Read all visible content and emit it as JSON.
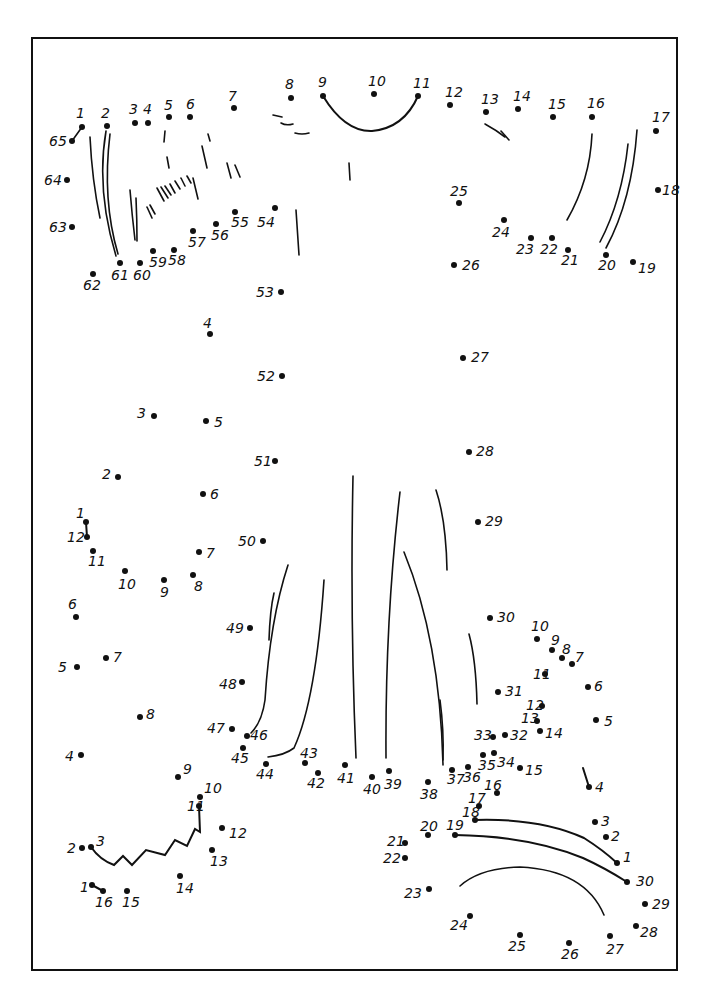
{
  "worksheet": {
    "title": "Dot-to-dot puzzle",
    "frame": {
      "x": 31,
      "y": 37,
      "width": 647,
      "height": 934
    },
    "ink_color": "#111111",
    "background": "#ffffff"
  },
  "puzzles": [
    {
      "name": "main-figure",
      "range": [
        1,
        65
      ],
      "dots": [
        {
          "n": "1",
          "x": 82,
          "y": 127,
          "lx": 76,
          "ly": 118
        },
        {
          "n": "2",
          "x": 107,
          "y": 126,
          "lx": 101,
          "ly": 118
        },
        {
          "n": "3",
          "x": 135,
          "y": 123,
          "lx": 129,
          "ly": 114
        },
        {
          "n": "4",
          "x": 148,
          "y": 123,
          "lx": 143,
          "ly": 114
        },
        {
          "n": "5",
          "x": 169,
          "y": 117,
          "lx": 164,
          "ly": 110
        },
        {
          "n": "6",
          "x": 190,
          "y": 117,
          "lx": 186,
          "ly": 109
        },
        {
          "n": "7",
          "x": 234,
          "y": 108,
          "lx": 228,
          "ly": 101
        },
        {
          "n": "8",
          "x": 291,
          "y": 98,
          "lx": 285,
          "ly": 89
        },
        {
          "n": "9",
          "x": 323,
          "y": 96,
          "lx": 318,
          "ly": 87
        },
        {
          "n": "10",
          "x": 374,
          "y": 94,
          "lx": 368,
          "ly": 86
        },
        {
          "n": "11",
          "x": 418,
          "y": 96,
          "lx": 413,
          "ly": 88
        },
        {
          "n": "12",
          "x": 450,
          "y": 105,
          "lx": 445,
          "ly": 97
        },
        {
          "n": "13",
          "x": 486,
          "y": 112,
          "lx": 481,
          "ly": 104
        },
        {
          "n": "14",
          "x": 518,
          "y": 109,
          "lx": 513,
          "ly": 101
        },
        {
          "n": "15",
          "x": 553,
          "y": 117,
          "lx": 548,
          "ly": 109
        },
        {
          "n": "16",
          "x": 592,
          "y": 117,
          "lx": 587,
          "ly": 108
        },
        {
          "n": "17",
          "x": 656,
          "y": 131,
          "lx": 652,
          "ly": 122
        },
        {
          "n": "18",
          "x": 658,
          "y": 190,
          "lx": 662,
          "ly": 195
        },
        {
          "n": "19",
          "x": 633,
          "y": 262,
          "lx": 638,
          "ly": 273
        },
        {
          "n": "20",
          "x": 606,
          "y": 255,
          "lx": 598,
          "ly": 270
        },
        {
          "n": "21",
          "x": 568,
          "y": 250,
          "lx": 561,
          "ly": 265
        },
        {
          "n": "22",
          "x": 552,
          "y": 238,
          "lx": 540,
          "ly": 254
        },
        {
          "n": "23",
          "x": 531,
          "y": 238,
          "lx": 516,
          "ly": 254
        },
        {
          "n": "24",
          "x": 504,
          "y": 220,
          "lx": 492,
          "ly": 237
        },
        {
          "n": "25",
          "x": 459,
          "y": 203,
          "lx": 450,
          "ly": 196
        },
        {
          "n": "26",
          "x": 454,
          "y": 265,
          "lx": 462,
          "ly": 270
        },
        {
          "n": "27",
          "x": 463,
          "y": 358,
          "lx": 471,
          "ly": 362
        },
        {
          "n": "28",
          "x": 469,
          "y": 452,
          "lx": 476,
          "ly": 456
        },
        {
          "n": "29",
          "x": 478,
          "y": 522,
          "lx": 485,
          "ly": 526
        },
        {
          "n": "30",
          "x": 490,
          "y": 618,
          "lx": 497,
          "ly": 622
        },
        {
          "n": "31",
          "x": 498,
          "y": 692,
          "lx": 505,
          "ly": 696
        },
        {
          "n": "32",
          "x": 505,
          "y": 735,
          "lx": 510,
          "ly": 740
        },
        {
          "n": "33",
          "x": 493,
          "y": 737,
          "lx": 474,
          "ly": 740
        },
        {
          "n": "34",
          "x": 494,
          "y": 753,
          "lx": 497,
          "ly": 767
        },
        {
          "n": "35",
          "x": 483,
          "y": 755,
          "lx": 478,
          "ly": 770
        },
        {
          "n": "36",
          "x": 468,
          "y": 767,
          "lx": 463,
          "ly": 782
        },
        {
          "n": "37",
          "x": 452,
          "y": 770,
          "lx": 447,
          "ly": 784
        },
        {
          "n": "38",
          "x": 428,
          "y": 782,
          "lx": 420,
          "ly": 799
        },
        {
          "n": "39",
          "x": 389,
          "y": 771,
          "lx": 384,
          "ly": 789
        },
        {
          "n": "40",
          "x": 372,
          "y": 777,
          "lx": 363,
          "ly": 794
        },
        {
          "n": "41",
          "x": 345,
          "y": 765,
          "lx": 337,
          "ly": 783
        },
        {
          "n": "42",
          "x": 318,
          "y": 773,
          "lx": 307,
          "ly": 788
        },
        {
          "n": "43",
          "x": 305,
          "y": 763,
          "lx": 300,
          "ly": 758
        },
        {
          "n": "44",
          "x": 266,
          "y": 764,
          "lx": 256,
          "ly": 779
        },
        {
          "n": "45",
          "x": 243,
          "y": 748,
          "lx": 231,
          "ly": 763
        },
        {
          "n": "46",
          "x": 247,
          "y": 736,
          "lx": 250,
          "ly": 740
        },
        {
          "n": "47",
          "x": 232,
          "y": 729,
          "lx": 207,
          "ly": 733
        },
        {
          "n": "48",
          "x": 242,
          "y": 682,
          "lx": 219,
          "ly": 689
        },
        {
          "n": "49",
          "x": 250,
          "y": 628,
          "lx": 226,
          "ly": 633
        },
        {
          "n": "50",
          "x": 263,
          "y": 541,
          "lx": 238,
          "ly": 546
        },
        {
          "n": "51",
          "x": 275,
          "y": 461,
          "lx": 254,
          "ly": 466
        },
        {
          "n": "52",
          "x": 282,
          "y": 376,
          "lx": 257,
          "ly": 381
        },
        {
          "n": "53",
          "x": 281,
          "y": 292,
          "lx": 256,
          "ly": 297
        },
        {
          "n": "54",
          "x": 275,
          "y": 208,
          "lx": 257,
          "ly": 227
        },
        {
          "n": "55",
          "x": 235,
          "y": 212,
          "lx": 231,
          "ly": 227
        },
        {
          "n": "56",
          "x": 216,
          "y": 224,
          "lx": 211,
          "ly": 240
        },
        {
          "n": "57",
          "x": 193,
          "y": 231,
          "lx": 188,
          "ly": 247
        },
        {
          "n": "58",
          "x": 174,
          "y": 250,
          "lx": 168,
          "ly": 265
        },
        {
          "n": "59",
          "x": 153,
          "y": 251,
          "lx": 149,
          "ly": 267
        },
        {
          "n": "60",
          "x": 140,
          "y": 263,
          "lx": 133,
          "ly": 280
        },
        {
          "n": "61",
          "x": 120,
          "y": 263,
          "lx": 111,
          "ly": 280
        },
        {
          "n": "62",
          "x": 93,
          "y": 274,
          "lx": 83,
          "ly": 290
        },
        {
          "n": "63",
          "x": 72,
          "y": 227,
          "lx": 49,
          "ly": 232
        },
        {
          "n": "64",
          "x": 67,
          "y": 180,
          "lx": 44,
          "ly": 185
        },
        {
          "n": "65",
          "x": 72,
          "y": 141,
          "lx": 49,
          "ly": 146
        }
      ]
    },
    {
      "name": "left-small-figure",
      "range": [
        1,
        12
      ],
      "dots": [
        {
          "n": "1",
          "x": 86,
          "y": 522,
          "lx": 76,
          "ly": 518
        },
        {
          "n": "2",
          "x": 118,
          "y": 477,
          "lx": 102,
          "ly": 479
        },
        {
          "n": "3",
          "x": 154,
          "y": 416,
          "lx": 137,
          "ly": 418
        },
        {
          "n": "4",
          "x": 210,
          "y": 334,
          "lx": 203,
          "ly": 328
        },
        {
          "n": "5",
          "x": 206,
          "y": 421,
          "lx": 214,
          "ly": 427
        },
        {
          "n": "6",
          "x": 203,
          "y": 494,
          "lx": 210,
          "ly": 499
        },
        {
          "n": "7",
          "x": 199,
          "y": 552,
          "lx": 206,
          "ly": 558
        },
        {
          "n": "8",
          "x": 193,
          "y": 575,
          "lx": 194,
          "ly": 591
        },
        {
          "n": "9",
          "x": 164,
          "y": 580,
          "lx": 160,
          "ly": 597
        },
        {
          "n": "10",
          "x": 125,
          "y": 571,
          "lx": 118,
          "ly": 589
        },
        {
          "n": "11",
          "x": 93,
          "y": 551,
          "lx": 88,
          "ly": 566
        },
        {
          "n": "12",
          "x": 87,
          "y": 537,
          "lx": 67,
          "ly": 542
        }
      ],
      "segments": [
        [
          1,
          12
        ]
      ]
    },
    {
      "name": "left-bottom-figure",
      "range": [
        1,
        16
      ],
      "dots": [
        {
          "n": "1",
          "x": 92,
          "y": 885,
          "lx": 80,
          "ly": 892
        },
        {
          "n": "2",
          "x": 82,
          "y": 848,
          "lx": 67,
          "ly": 853
        },
        {
          "n": "3",
          "x": 91,
          "y": 847,
          "lx": 96,
          "ly": 846
        },
        {
          "n": "4",
          "x": 81,
          "y": 755,
          "lx": 65,
          "ly": 761
        },
        {
          "n": "5",
          "x": 77,
          "y": 667,
          "lx": 58,
          "ly": 672
        },
        {
          "n": "6",
          "x": 76,
          "y": 617,
          "lx": 68,
          "ly": 609
        },
        {
          "n": "7",
          "x": 106,
          "y": 658,
          "lx": 113,
          "ly": 662
        },
        {
          "n": "8",
          "x": 140,
          "y": 717,
          "lx": 146,
          "ly": 719
        },
        {
          "n": "9",
          "x": 178,
          "y": 777,
          "lx": 183,
          "ly": 774
        },
        {
          "n": "10",
          "x": 200,
          "y": 797,
          "lx": 204,
          "ly": 793
        },
        {
          "n": "11",
          "x": 199,
          "y": 806,
          "lx": 187,
          "ly": 811
        },
        {
          "n": "12",
          "x": 222,
          "y": 828,
          "lx": 229,
          "ly": 838
        },
        {
          "n": "13",
          "x": 212,
          "y": 850,
          "lx": 210,
          "ly": 866
        },
        {
          "n": "14",
          "x": 180,
          "y": 876,
          "lx": 176,
          "ly": 893
        },
        {
          "n": "15",
          "x": 127,
          "y": 891,
          "lx": 122,
          "ly": 907
        },
        {
          "n": "16",
          "x": 103,
          "y": 891,
          "lx": 95,
          "ly": 907
        }
      ],
      "segments": [
        [
          1,
          16
        ]
      ]
    },
    {
      "name": "right-mid-figure",
      "range": [
        4,
        16
      ],
      "dots": [
        {
          "n": "4",
          "x": 589,
          "y": 787,
          "lx": 595,
          "ly": 792
        },
        {
          "n": "5",
          "x": 596,
          "y": 720,
          "lx": 604,
          "ly": 726
        },
        {
          "n": "6",
          "x": 588,
          "y": 687,
          "lx": 594,
          "ly": 691
        },
        {
          "n": "7",
          "x": 572,
          "y": 664,
          "lx": 575,
          "ly": 662
        },
        {
          "n": "8",
          "x": 562,
          "y": 658,
          "lx": 562,
          "ly": 654
        },
        {
          "n": "9",
          "x": 552,
          "y": 650,
          "lx": 551,
          "ly": 645
        },
        {
          "n": "10",
          "x": 537,
          "y": 639,
          "lx": 531,
          "ly": 631
        },
        {
          "n": "11",
          "x": 545,
          "y": 674,
          "lx": 533,
          "ly": 679
        },
        {
          "n": "12",
          "x": 542,
          "y": 706,
          "lx": 526,
          "ly": 710
        },
        {
          "n": "13",
          "x": 537,
          "y": 721,
          "lx": 521,
          "ly": 723
        },
        {
          "n": "14",
          "x": 540,
          "y": 731,
          "lx": 545,
          "ly": 738
        },
        {
          "n": "15",
          "x": 520,
          "y": 768,
          "lx": 525,
          "ly": 775
        },
        {
          "n": "16",
          "x": 497,
          "y": 793,
          "lx": 484,
          "ly": 790
        }
      ]
    },
    {
      "name": "right-bottom-figure",
      "range": [
        1,
        30
      ],
      "dots": [
        {
          "n": "1",
          "x": 617,
          "y": 863,
          "lx": 623,
          "ly": 862
        },
        {
          "n": "2",
          "x": 606,
          "y": 837,
          "lx": 611,
          "ly": 841
        },
        {
          "n": "3",
          "x": 595,
          "y": 822,
          "lx": 601,
          "ly": 826
        },
        {
          "n": "17",
          "x": 479,
          "y": 806,
          "lx": 468,
          "ly": 803
        },
        {
          "n": "18",
          "x": 475,
          "y": 820,
          "lx": 462,
          "ly": 817
        },
        {
          "n": "19",
          "x": 455,
          "y": 835,
          "lx": 446,
          "ly": 830
        },
        {
          "n": "20",
          "x": 428,
          "y": 835,
          "lx": 420,
          "ly": 831
        },
        {
          "n": "21",
          "x": 405,
          "y": 843,
          "lx": 387,
          "ly": 846
        },
        {
          "n": "22",
          "x": 405,
          "y": 858,
          "lx": 383,
          "ly": 863
        },
        {
          "n": "23",
          "x": 429,
          "y": 889,
          "lx": 404,
          "ly": 898
        },
        {
          "n": "24",
          "x": 470,
          "y": 916,
          "lx": 450,
          "ly": 930
        },
        {
          "n": "25",
          "x": 520,
          "y": 935,
          "lx": 508,
          "ly": 951
        },
        {
          "n": "26",
          "x": 569,
          "y": 943,
          "lx": 561,
          "ly": 959
        },
        {
          "n": "27",
          "x": 610,
          "y": 936,
          "lx": 606,
          "ly": 954
        },
        {
          "n": "28",
          "x": 636,
          "y": 926,
          "lx": 640,
          "ly": 937
        },
        {
          "n": "29",
          "x": 645,
          "y": 904,
          "lx": 652,
          "ly": 909
        },
        {
          "n": "30",
          "x": 627,
          "y": 882,
          "lx": 636,
          "ly": 886
        }
      ],
      "segments": [
        [
          18,
          1
        ],
        [
          19,
          30
        ]
      ]
    }
  ]
}
